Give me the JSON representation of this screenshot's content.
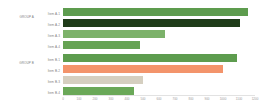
{
  "chart_data": {
    "type": "bar",
    "orientation": "horizontal",
    "title": "",
    "subtitle": "",
    "xlabel": "",
    "ylabel": "",
    "xlim": [
      0,
      1200
    ],
    "grid": false,
    "legend": null,
    "groups": [
      {
        "label": "GROUP A",
        "categories": [
          "Item A-1",
          "Item A-2",
          "Item A-3",
          "Item A-4"
        ],
        "values": [
          1155,
          1105,
          638,
          481
        ],
        "colors": [
          "#5d9c4e",
          "#1f3c19",
          "#7cb26a",
          "#66a354"
        ]
      },
      {
        "label": "GROUP B",
        "categories": [
          "Item B-1",
          "Item B-2",
          "Item B-3",
          "Item B-4"
        ],
        "values": [
          1088,
          1000,
          500,
          444
        ],
        "colors": [
          "#5d9c4e",
          "#f3946b",
          "#d5cfc0",
          "#6aa858"
        ]
      }
    ],
    "categories": [
      "Item A-1",
      "Item A-2",
      "Item A-3",
      "Item A-4",
      "Item B-1",
      "Item B-2",
      "Item B-3",
      "Item B-4"
    ],
    "values": [
      1155,
      1105,
      638,
      481,
      1088,
      1000,
      500,
      444
    ],
    "colors": [
      "#5d9c4e",
      "#1f3c19",
      "#7cb26a",
      "#66a354",
      "#5d9c4e",
      "#f3946b",
      "#d5cfc0",
      "#6aa858"
    ],
    "xticks": [
      0,
      100,
      200,
      300,
      400,
      500,
      600,
      700,
      800,
      900,
      1000,
      1100,
      1200
    ],
    "xticklabels": [
      "0",
      "100",
      "200",
      "300",
      "400",
      "500",
      "600",
      "700",
      "800",
      "900",
      "1000",
      "1100",
      "1200"
    ]
  },
  "style": {
    "background": "#ffffff",
    "axis_color": "#e2e2e2",
    "label_color": "#7f7f7f",
    "tick_color": "#9a9a9a"
  }
}
